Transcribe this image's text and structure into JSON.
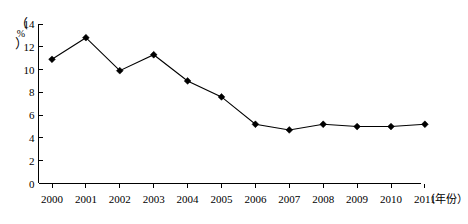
{
  "chart_data": {
    "type": "line",
    "title": "",
    "xlabel": "（年份）",
    "ylabel": "（%）",
    "categories": [
      "2000",
      "2001",
      "2002",
      "2003",
      "2004",
      "2005",
      "2006",
      "2007",
      "2008",
      "2009",
      "2010",
      "2011"
    ],
    "values": [
      10.9,
      12.8,
      9.9,
      11.3,
      9.0,
      7.6,
      5.2,
      4.7,
      5.2,
      5.0,
      5.0,
      5.2
    ],
    "series": [
      {
        "name": "",
        "values": [
          10.9,
          12.8,
          9.9,
          11.3,
          9.0,
          7.6,
          5.2,
          4.7,
          5.2,
          5.0,
          5.0,
          5.2
        ]
      }
    ],
    "ylim": [
      0,
      14
    ],
    "yticks": [
      0,
      2,
      4,
      6,
      8,
      10,
      12,
      14
    ],
    "ytick_labels": [
      "0",
      "2",
      "4",
      "6",
      "8",
      "10",
      "12",
      "14"
    ],
    "grid": false,
    "legend": "none",
    "marker": "diamond",
    "line_color": "#000000",
    "marker_color": "#000000",
    "axis_color": "#000000"
  },
  "axes": {
    "y_unit_symbol": "%",
    "y_unit_open_paren": "（",
    "y_unit_close_paren": "）",
    "x_caption": "（年份）"
  }
}
